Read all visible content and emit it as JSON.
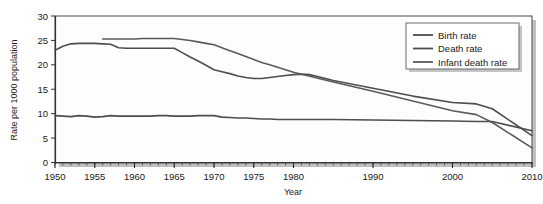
{
  "chart_data": {
    "type": "line",
    "title": "",
    "xlabel": "Year",
    "ylabel": "Rate per 1000 population",
    "xlim": [
      1950,
      2010
    ],
    "ylim": [
      0,
      30
    ],
    "yticks": [
      0,
      5,
      10,
      15,
      20,
      25,
      30
    ],
    "xticks": [
      1950,
      1955,
      1960,
      1965,
      1970,
      1975,
      1980,
      1990,
      2000,
      2010
    ],
    "xtick_labels": [
      "1950",
      "1955",
      "1960",
      "1965",
      "1970",
      "1975",
      "1980",
      "1990",
      "2000",
      "2010"
    ],
    "minor_xtick_interval": 1,
    "grid": false,
    "legend_position": "top-right",
    "series": [
      {
        "name": "Birth rate",
        "color": "#4d4d4d",
        "x": [
          1950,
          1951,
          1952,
          1953,
          1954,
          1955,
          1956,
          1957,
          1958,
          1959,
          1960,
          1961,
          1962,
          1963,
          1964,
          1965,
          1966,
          1967,
          1968,
          1969,
          1970,
          1971,
          1972,
          1973,
          1974,
          1975,
          1976,
          1977,
          1978,
          1979,
          1980,
          1981,
          1982,
          1983,
          1984,
          1985,
          1990,
          1995,
          2000,
          2003,
          2005,
          2010
        ],
        "values": [
          23.0,
          23.8,
          24.3,
          24.4,
          24.4,
          24.4,
          24.3,
          24.2,
          23.5,
          23.4,
          23.4,
          23.4,
          23.4,
          23.4,
          23.4,
          23.4,
          22.5,
          21.6,
          20.8,
          19.9,
          19.0,
          18.6,
          18.2,
          17.7,
          17.4,
          17.2,
          17.2,
          17.4,
          17.6,
          17.8,
          18.0,
          18.1,
          18.0,
          17.6,
          17.2,
          16.8,
          15.2,
          13.6,
          12.3,
          12.0,
          11.0,
          5.5
        ]
      },
      {
        "name": "Death rate",
        "color": "#4d4d4d",
        "x": [
          1950,
          1951,
          1952,
          1953,
          1954,
          1955,
          1956,
          1957,
          1958,
          1959,
          1960,
          1961,
          1962,
          1963,
          1964,
          1965,
          1966,
          1967,
          1968,
          1969,
          1970,
          1971,
          1972,
          1973,
          1974,
          1975,
          1976,
          1977,
          1978,
          1979,
          1980,
          1985,
          1990,
          1995,
          2000,
          2003,
          2005,
          2010
        ],
        "values": [
          9.6,
          9.5,
          9.4,
          9.6,
          9.5,
          9.3,
          9.4,
          9.6,
          9.5,
          9.5,
          9.5,
          9.5,
          9.5,
          9.6,
          9.6,
          9.5,
          9.5,
          9.5,
          9.6,
          9.6,
          9.6,
          9.3,
          9.2,
          9.1,
          9.1,
          9.0,
          8.9,
          8.9,
          8.8,
          8.8,
          8.8,
          8.8,
          8.7,
          8.6,
          8.5,
          8.4,
          8.4,
          6.5
        ]
      },
      {
        "name": "Infant death rate",
        "color": "#5a5a5a",
        "x": [
          1956,
          1957,
          1958,
          1959,
          1960,
          1961,
          1962,
          1963,
          1964,
          1965,
          1966,
          1967,
          1968,
          1969,
          1970,
          1971,
          1972,
          1973,
          1974,
          1975,
          1976,
          1977,
          1978,
          1979,
          1980,
          1985,
          1990,
          1995,
          2000,
          2003,
          2005,
          2010
        ],
        "values": [
          25.3,
          25.3,
          25.3,
          25.3,
          25.3,
          25.4,
          25.4,
          25.4,
          25.4,
          25.4,
          25.2,
          25.0,
          24.7,
          24.4,
          24.1,
          23.5,
          22.9,
          22.3,
          21.7,
          21.1,
          20.5,
          20.0,
          19.5,
          19.0,
          18.5,
          16.5,
          14.6,
          12.6,
          10.6,
          9.8,
          8.2,
          3.0
        ]
      }
    ]
  },
  "legend": {
    "items": [
      {
        "label": "Birth rate"
      },
      {
        "label": "Death rate"
      },
      {
        "label": "Infant death rate"
      }
    ]
  },
  "axes": {
    "x_title": "Year",
    "y_title": "Rate per 1000 population",
    "y_tick_labels": [
      "0",
      "5",
      "10",
      "15",
      "20",
      "25",
      "30"
    ],
    "x_tick_labels": [
      "1950",
      "1955",
      "1960",
      "1965",
      "1970",
      "1975",
      "1980",
      "1990",
      "2000",
      "2010"
    ]
  },
  "colors": {
    "line": "#4d4d4d",
    "axis": "#3a3a3a",
    "text": "#1a1a1a",
    "shadow": "#b8b8b8",
    "plot_bg": "#fdfdfd"
  }
}
